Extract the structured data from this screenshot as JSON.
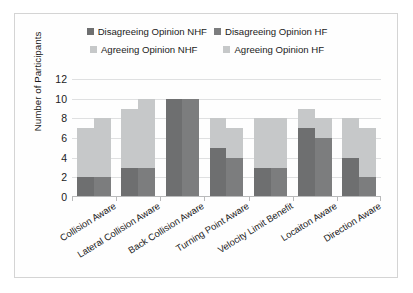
{
  "chart_data": {
    "type": "bar",
    "title": "",
    "subtitle": "",
    "xlabel": "",
    "ylabel": "Number of Participants",
    "ylim": [
      0,
      12
    ],
    "yticks": [
      0,
      2,
      4,
      6,
      8,
      10,
      12
    ],
    "grid": true,
    "stacked": true,
    "grouped": true,
    "legend_position": "top",
    "categories": [
      "Collision Aware",
      "Lateral Collision Aware",
      "Back Collision Aware",
      "Turning Point Aware",
      "Velocity Limit Benefit",
      "Locaiton Aware",
      "Direction Aware"
    ],
    "series": [
      {
        "name": "Disagreeing Opinion NHF",
        "color": "#6e6f70",
        "bar_index": 0,
        "stack_part": "bottom",
        "values": [
          2,
          3,
          10,
          5,
          3,
          7,
          4
        ]
      },
      {
        "name": "Agreeing Opinion NHF",
        "color": "#c6c8c9",
        "bar_index": 0,
        "stack_part": "top",
        "values": [
          5,
          6,
          0,
          3,
          5,
          2,
          4
        ]
      },
      {
        "name": "Disagreeing Opinion HF",
        "color": "#7c7d7e",
        "bar_index": 1,
        "stack_part": "bottom",
        "values": [
          2,
          3,
          10,
          4,
          3,
          6,
          2
        ]
      },
      {
        "name": "Agreeing Opinion HF",
        "color": "#c6c8c9",
        "bar_index": 1,
        "stack_part": "top",
        "values": [
          6,
          7,
          0,
          3,
          5,
          2,
          5
        ]
      }
    ],
    "totals": {
      "NHF": [
        7,
        9,
        10,
        8,
        8,
        9,
        8
      ],
      "HF": [
        8,
        10,
        10,
        7,
        8,
        8,
        7
      ]
    }
  },
  "legend": {
    "rows": [
      [
        {
          "label": "Disagreeing Opinion NHF",
          "color": "#6e6f70"
        },
        {
          "label": "Disagreeing Opinion HF",
          "color": "#7c7d7e"
        }
      ],
      [
        {
          "label": "Agreeing Opinion NHF",
          "color": "#c6c8c9"
        },
        {
          "label": "Agreeing Opinion HF",
          "color": "#c6c8c9"
        }
      ]
    ]
  },
  "axes": {
    "y_title": "Number of Participants",
    "y_ticks": [
      "0",
      "2",
      "4",
      "6",
      "8",
      "10",
      "12"
    ],
    "x_ticks": [
      "Collision Aware",
      "Lateral Collision Aware",
      "Back Collision Aware",
      "Turning Point Aware",
      "Velocity Limit Benefit",
      "Locaiton Aware",
      "Direction Aware"
    ]
  }
}
